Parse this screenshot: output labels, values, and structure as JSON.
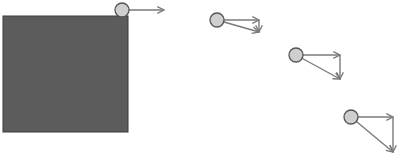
{
  "diagram": {
    "colors": {
      "background": "#ffffff",
      "block_fill": "#5c5c5c",
      "block_stroke": "#3a3a3a",
      "ball_fill": "#cfcfcf",
      "ball_stroke": "#555555",
      "arrow": "#7a7a7a"
    },
    "block": {
      "x": 3,
      "y": 16,
      "width": 125,
      "height": 116
    },
    "ball_radius": 7,
    "positions": [
      {
        "cx": 122,
        "cy": 10,
        "vx_end": 164,
        "vy_end": 10,
        "show_vertical": false,
        "show_resultant": false
      },
      {
        "cx": 217,
        "cy": 20,
        "vx_end": 259,
        "vy_end": 32,
        "show_vertical": true,
        "show_resultant": true
      },
      {
        "cx": 296,
        "cy": 55,
        "vx_end": 340,
        "vy_end": 79,
        "show_vertical": true,
        "show_resultant": true
      },
      {
        "cx": 351,
        "cy": 117,
        "vx_end": 393,
        "vy_end": 152,
        "show_vertical": true,
        "show_resultant": true
      }
    ]
  }
}
